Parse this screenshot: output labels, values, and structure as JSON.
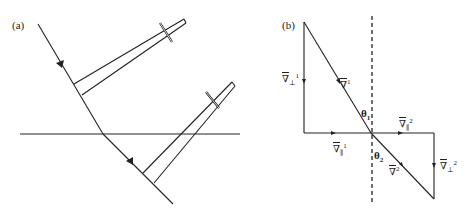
{
  "figure": {
    "panel_a": {
      "label": "(a)",
      "elements": [
        "incident ray",
        "interface line",
        "refracted ray",
        "upper wavefront pointer",
        "lower wavefront pointer"
      ]
    },
    "panel_b": {
      "label": "(b)",
      "vectors": {
        "v_perp_1": {
          "symbol": "∇",
          "sub": "⊥",
          "sup": "1"
        },
        "v_1": {
          "symbol": "∇",
          "sup": "1"
        },
        "v_par_1": {
          "symbol": "∇",
          "sub": "∥",
          "sup": "1"
        },
        "v_par_2": {
          "symbol": "∇",
          "sub": "∥",
          "sup": "2"
        },
        "v_2": {
          "symbol": "∇",
          "sup": "2"
        },
        "v_perp_2": {
          "symbol": "∇",
          "sub": "⊥",
          "sup": "2"
        }
      },
      "angles": {
        "theta_1": {
          "symbol": "θ",
          "sub": "1"
        },
        "theta_2": {
          "symbol": "θ",
          "sub": "2"
        }
      }
    },
    "colors": {
      "ink": "#222222",
      "background": "#ffffff"
    }
  }
}
